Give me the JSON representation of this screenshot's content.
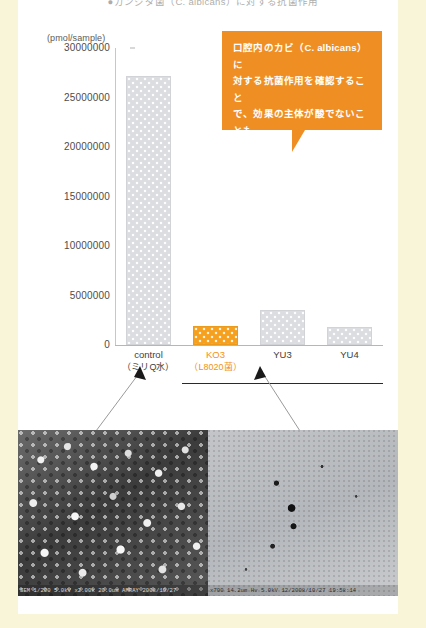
{
  "page": {
    "background_color": "#f9f5d8",
    "panel_color": "#ffffff",
    "accent_color": "#f29222",
    "callout_color": "#ef8f23"
  },
  "heading": {
    "text": "●カンジダ菌（C. albicans）に対する抗菌作用"
  },
  "callout": {
    "line1": "口腔内のカビ（C. albicans）に",
    "line2": "対する抗菌作用を確認すること",
    "line3": "で、効果の主体が酸でないことも",
    "line4": "確認しました。"
  },
  "chart_data": {
    "type": "bar",
    "title": "",
    "xlabel": "",
    "ylabel": "(pmol/sample)",
    "ylim": [
      0,
      30000000
    ],
    "grid": false,
    "legend": "none",
    "categories": [
      "control",
      "KO3",
      "YU3",
      "YU4"
    ],
    "category_sublabels": [
      "（ミリQ水）",
      "（L8020菌）",
      "",
      ""
    ],
    "values": [
      27200000,
      1900000,
      3500000,
      1800000
    ],
    "tick_labels": [
      "30000000",
      "25000000",
      "20000000",
      "15000000",
      "10000000",
      "5000000",
      "0"
    ],
    "tick_values": [
      30000000,
      25000000,
      20000000,
      15000000,
      10000000,
      5000000,
      0
    ],
    "highlight_index": 1,
    "bar_color": "#dcdde1",
    "highlight_color": "#f5a11f"
  },
  "photos": [
    {
      "name": "sem-control",
      "caption": "SEM 1/200  5.0kV  x2.00k  20.0um  AMRAY  2008/10/27"
    },
    {
      "name": "sem-ko3",
      "caption": "x700  14.2um  Hv 5.0kV   12/2008/10/27  19:58:14"
    }
  ]
}
